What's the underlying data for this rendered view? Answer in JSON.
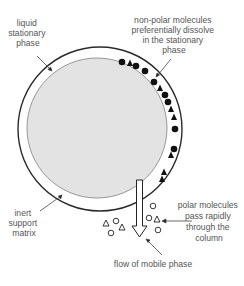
{
  "diagram": {
    "colors": {
      "background": "#ffffff",
      "support_fill": "#e3e3e3",
      "support_stroke": "#8c8c8c",
      "outer_ring": "#2a2a2a",
      "molecule_dark": "#111111",
      "label_text": "#555555",
      "leader_line": "#444444"
    },
    "labels": {
      "stationary_phase": [
        "liquid",
        "stationary",
        "phase"
      ],
      "non_polar": [
        "non-polar molecules",
        "preferentially dissolve",
        "in the stationary",
        "phase"
      ],
      "inert_support": [
        "inert",
        "support",
        "matrix"
      ],
      "polar": [
        "polar molecules",
        "pass rapidly",
        "through the",
        "column"
      ],
      "mobile_phase": "flow of mobile phase"
    },
    "legend_semantics": {
      "filled-circle": "non-polar molecule",
      "filled-triangle": "non-polar molecule",
      "open-circle": "polar molecule",
      "open-triangle": "polar molecule"
    }
  }
}
